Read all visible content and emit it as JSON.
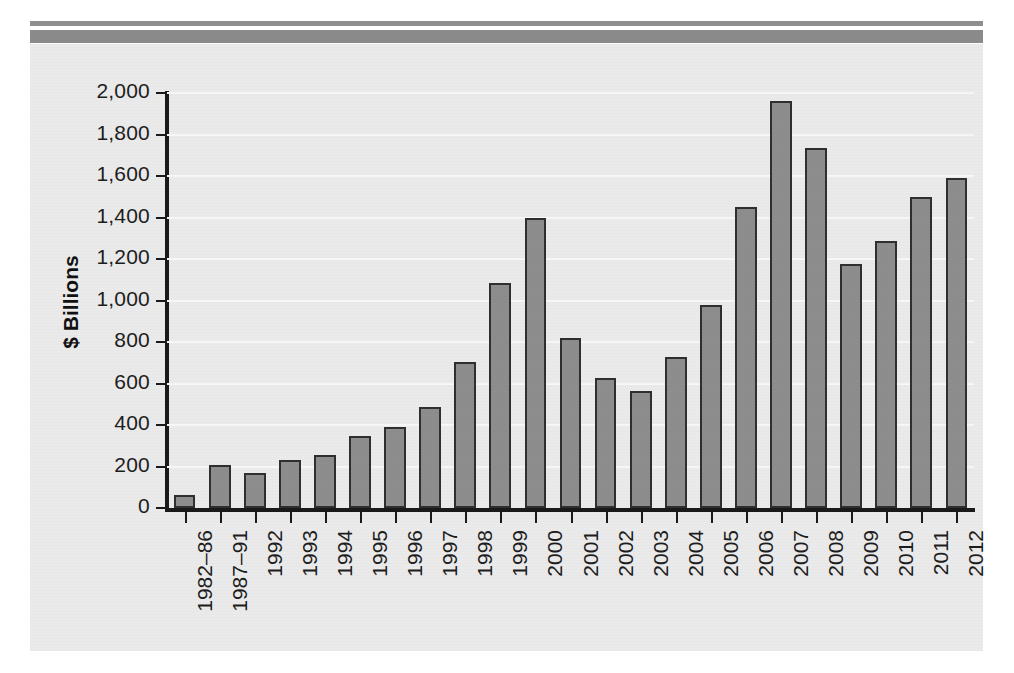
{
  "decor": {
    "rule_thin_color": "#8f8f8f",
    "rule_thick_color": "#8a8a8a"
  },
  "theme": {
    "panel_background": "#eaeaea",
    "bar_fill": "#8d8d8d",
    "bar_stroke": "#2f2f2f",
    "axis_color": "#1a1a1a",
    "gridline_color": "#f7f7f7",
    "text_color": "#1d1d1d"
  },
  "chart_data": {
    "type": "bar",
    "title": "",
    "subtitle": "",
    "xlabel": "",
    "ylabel": "$ Billions",
    "ylim": [
      0,
      2000
    ],
    "ytick_step": 200,
    "ytick_labels": [
      "2,000",
      "1,800",
      "1,600",
      "1,400",
      "1,200",
      "1,000",
      "800",
      "600",
      "400",
      "200",
      "0"
    ],
    "ytick_values": [
      2000,
      1800,
      1600,
      1400,
      1200,
      1000,
      800,
      600,
      400,
      200,
      0
    ],
    "grid": true,
    "legend": false,
    "categories": [
      "1982–86",
      "1987–91",
      "1992",
      "1993",
      "1994",
      "1995",
      "1996",
      "1997",
      "1998",
      "1999",
      "2000",
      "2001",
      "2002",
      "2003",
      "2004",
      "2005",
      "2006",
      "2007",
      "2008",
      "2009",
      "2010",
      "2011",
      "2012"
    ],
    "values": [
      65,
      205,
      170,
      230,
      255,
      345,
      390,
      485,
      705,
      1085,
      1400,
      820,
      625,
      565,
      730,
      980,
      1450,
      1960,
      1735,
      1175,
      1285,
      1500,
      1590
    ]
  }
}
